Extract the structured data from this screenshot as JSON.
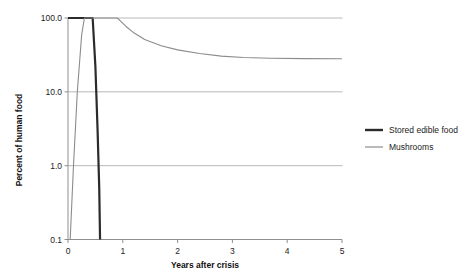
{
  "chart_data": {
    "type": "line",
    "title": "",
    "xlabel": "Years after crisis",
    "ylabel": "Percent of human food",
    "xlim": [
      0,
      5
    ],
    "ylim": [
      0.1,
      100
    ],
    "yscale": "log",
    "grid": true,
    "grid_axis": "y",
    "legend_position": "right",
    "xticks": [
      "0",
      "1",
      "2",
      "3",
      "4",
      "5"
    ],
    "xtick_values": [
      0,
      1,
      2,
      3,
      4,
      5
    ],
    "yticks": [
      "0.1",
      "1.0",
      "10.0",
      "100.0"
    ],
    "ytick_values": [
      0.1,
      1,
      10,
      100
    ],
    "series": [
      {
        "name": "Stored edible food",
        "color": "#2b2b2b",
        "width": 2.2,
        "points": [
          [
            0.0,
            100
          ],
          [
            0.3,
            100
          ],
          [
            0.45,
            100
          ],
          [
            0.5,
            22
          ],
          [
            0.54,
            3.0
          ],
          [
            0.57,
            0.5
          ],
          [
            0.585,
            0.1
          ]
        ]
      },
      {
        "name": "Mushrooms",
        "color": "#8c8c8c",
        "width": 1.1,
        "points": [
          [
            0.04,
            0.1
          ],
          [
            0.1,
            1.0
          ],
          [
            0.17,
            10
          ],
          [
            0.25,
            60
          ],
          [
            0.3,
            100
          ],
          [
            0.9,
            100
          ],
          [
            0.95,
            92
          ],
          [
            1.05,
            78
          ],
          [
            1.2,
            63
          ],
          [
            1.4,
            51
          ],
          [
            1.7,
            42
          ],
          [
            2.0,
            37
          ],
          [
            2.4,
            33
          ],
          [
            2.8,
            30.5
          ],
          [
            3.2,
            29.2
          ],
          [
            3.7,
            28.5
          ],
          [
            4.3,
            28.2
          ],
          [
            5.0,
            28.0
          ]
        ]
      }
    ],
    "legend_entries": [
      {
        "label": "Stored edible food",
        "color": "#2b2b2b",
        "width": 2.4
      },
      {
        "label": "Mushrooms",
        "color": "#8c8c8c",
        "width": 1.2
      }
    ]
  }
}
